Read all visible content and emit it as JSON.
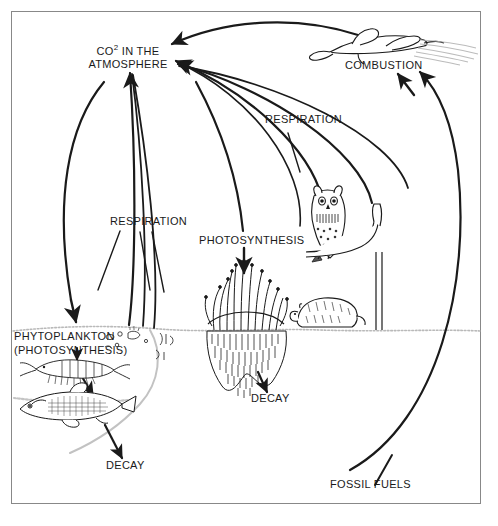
{
  "diagram": {
    "type": "carbon-cycle-illustration",
    "frame_color": "#888888",
    "ink_color": "#1a1a1a",
    "labels": {
      "atmosphere_line1": "CO",
      "atmosphere_sup": "2",
      "atmosphere_line1_rest": " IN THE",
      "atmosphere_line2": "ATMOSPHERE",
      "combustion": "COMBUSTION",
      "respiration_right": "RESPIRATION",
      "respiration_left": "RESPIRATION",
      "photosynthesis": "PHOTOSYNTHESIS",
      "phytoplankton_line1": "PHYTOPLANKTON",
      "phytoplankton_line2": "(PHOTOSYNTHESIS)",
      "decay_water": "DECAY",
      "decay_land": "DECAY",
      "fossil_fuels": "FOSSIL FUELS"
    },
    "organisms": [
      {
        "name": "airplane",
        "label": "COMBUSTION"
      },
      {
        "name": "owl",
        "label": ""
      },
      {
        "name": "groundhog",
        "label": ""
      },
      {
        "name": "grass-with-roots",
        "label": "DECAY"
      },
      {
        "name": "krill",
        "label": ""
      },
      {
        "name": "fish",
        "label": ""
      },
      {
        "name": "phytoplankton",
        "label": "PHYTOPLANKTON (PHOTOSYNTHESIS)"
      }
    ],
    "flows": [
      {
        "from": "airplane",
        "to": "atmosphere",
        "label": "COMBUSTION"
      },
      {
        "from": "owl",
        "to": "atmosphere",
        "label": "RESPIRATION"
      },
      {
        "from": "groundhog",
        "to": "atmosphere",
        "label": "RESPIRATION"
      },
      {
        "from": "atmosphere",
        "to": "grass",
        "label": "PHOTOSYNTHESIS"
      },
      {
        "from": "atmosphere",
        "to": "phytoplankton",
        "label": "PHYTOPLANKTON (PHOTOSYNTHESIS)"
      },
      {
        "from": "phytoplankton",
        "to": "atmosphere",
        "label": "RESPIRATION"
      },
      {
        "from": "fish",
        "to": "decay-water",
        "label": "DECAY"
      },
      {
        "from": "krill",
        "to": "fish",
        "label": ""
      },
      {
        "from": "grass",
        "to": "decay-land",
        "label": "DECAY"
      },
      {
        "from": "fossil-fuels",
        "to": "combustion",
        "label": "FOSSIL FUELS"
      }
    ]
  }
}
